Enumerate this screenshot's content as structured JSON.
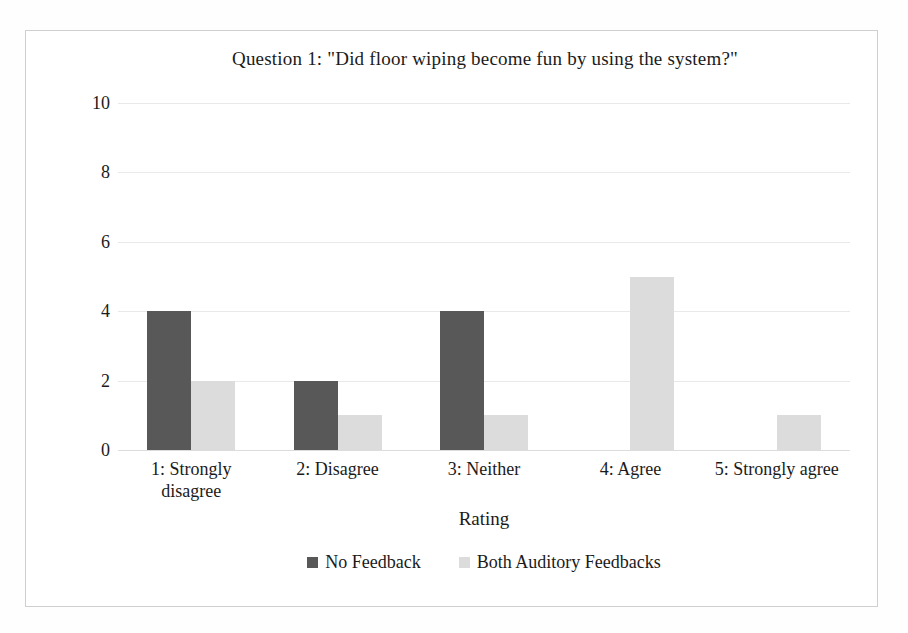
{
  "figure": {
    "title": "Question 1: \"Did floor wiping become fun  by using the system?\"",
    "border_color": "#cfcfcf",
    "background": "#ffffff"
  },
  "axes": {
    "y_title": "Number of participants",
    "x_title": "Rating",
    "gridline_color": "#e9e9e9"
  },
  "legend": {
    "position": "bottom-center",
    "items": [
      {
        "label": "No Feedback",
        "color": "#585858",
        "marker": "square-swatch"
      },
      {
        "label": "Both Auditory Feedbacks",
        "color": "#dcdcdc",
        "marker": "square-swatch"
      }
    ]
  },
  "chart_data": {
    "type": "bar",
    "title": "Question 1: \"Did floor wiping become fun  by using the system?\"",
    "xlabel": "Rating",
    "ylabel": "Number of participants",
    "ylim": [
      0,
      10
    ],
    "yticks": [
      0,
      2,
      4,
      6,
      8,
      10
    ],
    "ytick_labels": [
      "0",
      "2",
      "4",
      "6",
      "8",
      "10"
    ],
    "grid": true,
    "grid_axis": "y",
    "legend_position": "bottom-center",
    "categories": [
      "1: Strongly disagree",
      "2: Disagree",
      "3: Neither",
      "4: Agree",
      "5: Strongly agree"
    ],
    "category_display": [
      [
        "1: Strongly",
        "disagree"
      ],
      [
        "2: Disagree"
      ],
      [
        "3: Neither"
      ],
      [
        "4: Agree"
      ],
      [
        "5: Strongly agree"
      ]
    ],
    "series": [
      {
        "name": "No Feedback",
        "color": "#585858",
        "values": [
          4,
          2,
          4,
          0,
          0
        ]
      },
      {
        "name": "Both Auditory Feedbacks",
        "color": "#dcdcdc",
        "values": [
          2,
          1,
          1,
          5,
          1
        ]
      }
    ]
  }
}
